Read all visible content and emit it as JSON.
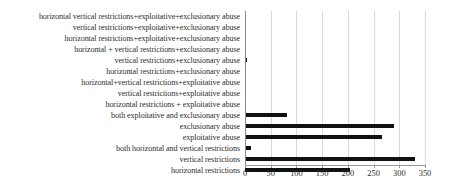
{
  "chart_data": {
    "type": "bar",
    "orientation": "horizontal",
    "title": "",
    "xlabel": "",
    "ylabel": "",
    "xlim": [
      0,
      350
    ],
    "ylim": null,
    "grid": "vertical-only",
    "legend": "none",
    "bar_color": "#111111",
    "gridline_color": "#d9d9d9",
    "axis_color": "#8a8a8a",
    "xticks": [
      0,
      50,
      100,
      150,
      200,
      250,
      300,
      350
    ],
    "xticklabels": [
      "0",
      "50",
      "100",
      "150",
      "200",
      "250",
      "300",
      "350"
    ],
    "categories": [
      "horizontal vertical restrictions+exploitative+exclusionary abuse",
      "vertical restrictions+exploitative+exclusionary abuse",
      "horizontal restrictions+exploitative+exclusionary abuse",
      "horizontal + vertical restrictions+exclusionary abuse",
      "vertical restrictions+exclusionary abuse",
      "horizontal restrictions+exclusionary abuse",
      "horizontal+vertical restrictions+exploitative abuse",
      "vertical restrictions+exploitative abuse",
      "horizontal restrictions + exploitative abuse",
      "both exploitative and exclusionary abuse",
      "exclusionary abuse",
      "exploitative abuse",
      "both horizontal and vertical restrictions",
      "vertical restrictions",
      "horizontal restrictions"
    ],
    "values": [
      0,
      0,
      0,
      0,
      3,
      0,
      0,
      0,
      0,
      82,
      290,
      267,
      12,
      330,
      205
    ]
  }
}
